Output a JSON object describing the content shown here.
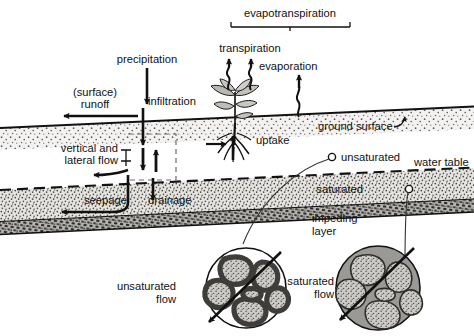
{
  "figure": {
    "type": "hydrology-cross-section"
  },
  "labels": {
    "evapotranspiration": "evapotranspiration",
    "transpiration": "transpiration",
    "evaporation": "evaporation",
    "precipitation": "precipitation",
    "infiltration": "infiltration",
    "surface_runoff_line1": "(surface)",
    "surface_runoff_line2": "runoff",
    "ground_surface": "ground surface",
    "uptake": "uptake",
    "vertical_lateral_line1": "vertical and",
    "vertical_lateral_line2": "lateral flow",
    "seepage": "seepage",
    "drainage": "drainage",
    "unsaturated": "unsaturated",
    "saturated": "saturated",
    "water_table": "water table",
    "impeding_layer_line1": "impeding",
    "impeding_layer_line2": "layer",
    "unsaturated_flow_line1": "unsaturated",
    "unsaturated_flow_line2": "flow",
    "saturated_flow_line1": "saturated",
    "saturated_flow_line2": "flow"
  },
  "icons": {
    "precipitation_arrow": "down-arrow-icon",
    "infiltration_arrow": "down-arrow-icon",
    "runoff_arrow": "left-arrow-icon",
    "transpiration_arrow": "wavy-up-arrow-icon",
    "evaporation_arrow": "wavy-up-arrow-icon",
    "uptake_arrow": "up-arrow-icon",
    "seepage_arrow": "curved-left-arrow-icon",
    "drainage_arrow": "down-arrow-icon",
    "vertical_flow_arrows": "up-down-arrow-pair-icon",
    "plant": "plant-icon",
    "roots": "root-icon",
    "bracket": "span-bracket-icon",
    "unsaturated_marker": "open-circle-marker-icon",
    "saturated_marker": "open-circle-marker-icon",
    "unsaturated_detail": "soil-pore-unsaturated-icon",
    "saturated_detail": "soil-pore-saturated-icon",
    "flow_direction_arrow": "diagonal-arrow-icon"
  },
  "colors": {
    "background": "#ffffff",
    "ink": "#111111",
    "unsaturated_soil": "#f2f0ee",
    "saturated_soil": "#dedcd8",
    "impeding_layer": "#b8b6b2",
    "grain_fill": "#c9c7c3",
    "water_gray": "#9b9995",
    "water_film_dark": "#4d4b48"
  }
}
